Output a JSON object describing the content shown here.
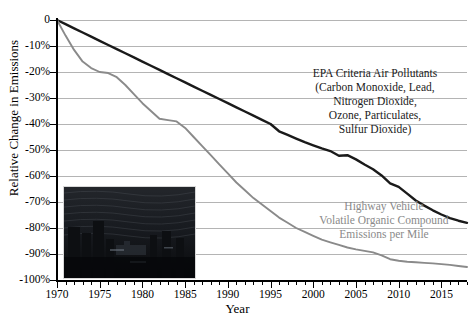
{
  "chart_data": {
    "type": "line",
    "title": "",
    "xlabel": "Year",
    "ylabel": "Relative Change in Emissions",
    "xlim": [
      1970,
      2018
    ],
    "ylim": [
      -100,
      0
    ],
    "grid": true,
    "legend_position": "inline-annotation",
    "x_ticks": [
      "1970",
      "1975",
      "1980",
      "1985",
      "1990",
      "1995",
      "2000",
      "2005",
      "2010",
      "2015"
    ],
    "y_ticks": [
      "0",
      "-10%",
      "-20%",
      "-30%",
      "-40%",
      "-50%",
      "-60%",
      "-70%",
      "-80%",
      "-90%",
      "-100%"
    ],
    "x": [
      1970,
      1971,
      1972,
      1973,
      1974,
      1975,
      1976,
      1977,
      1978,
      1979,
      1980,
      1981,
      1982,
      1983,
      1984,
      1985,
      1986,
      1987,
      1988,
      1989,
      1990,
      1991,
      1992,
      1993,
      1994,
      1995,
      1996,
      1997,
      1998,
      1999,
      2000,
      2001,
      2002,
      2003,
      2004,
      2005,
      2006,
      2007,
      2008,
      2009,
      2010,
      2011,
      2012,
      2013,
      2014,
      2015,
      2016,
      2017,
      2018
    ],
    "series": [
      {
        "name": "EPA Criteria Air Pollutants",
        "color": "#1a1a1a",
        "values": [
          0,
          -1.6,
          -3.2,
          -4.8,
          -6.4,
          -8.0,
          -9.6,
          -11.2,
          -12.8,
          -14.4,
          -16.0,
          -17.6,
          -19.2,
          -20.8,
          -22.4,
          -24.0,
          -25.6,
          -27.2,
          -28.8,
          -30.4,
          -32.0,
          -33.6,
          -35.2,
          -36.8,
          -38.4,
          -40.0,
          -42.8,
          -44.2,
          -45.6,
          -47.0,
          -48.2,
          -49.4,
          -50.4,
          -52.2,
          -52.0,
          -53.6,
          -55.6,
          -57.4,
          -59.8,
          -62.8,
          -64.2,
          -66.8,
          -69.4,
          -71.4,
          -73.2,
          -74.8,
          -76.2,
          -77.2,
          -78.0
        ]
      },
      {
        "name": "Highway Vehicle Volatile Organic Compound Emissions per Mile",
        "color": "#8a8a8a",
        "values": [
          0,
          -6.0,
          -11.5,
          -16.0,
          -18.5,
          -20.0,
          -20.4,
          -22.0,
          -25.0,
          -28.5,
          -32.0,
          -35.0,
          -38.0,
          -38.5,
          -39.0,
          -41.5,
          -45.0,
          -48.5,
          -52.0,
          -55.5,
          -59.0,
          -62.5,
          -65.5,
          -68.5,
          -71.0,
          -73.5,
          -76.0,
          -78.0,
          -80.0,
          -81.5,
          -83.0,
          -84.5,
          -85.5,
          -86.5,
          -87.5,
          -88.2,
          -88.8,
          -89.4,
          -90.5,
          -92.0,
          -92.6,
          -93.0,
          -93.2,
          -93.4,
          -93.6,
          -93.9,
          -94.2,
          -94.6,
          -95.0
        ]
      }
    ],
    "annotations": [
      {
        "id": "annot-black",
        "lines": [
          "EPA Criteria Air Pollutants",
          "(Carbon Monoxide, Lead,",
          "Nitrogen Dioxide,",
          "Ozone, Particulates,",
          "Sulfur Dioxide)"
        ],
        "color": "#1a1a1a"
      },
      {
        "id": "annot-gray",
        "lines": [
          "Highway Vehicle",
          "Volatile Organic Compound",
          "Emissions per Mile"
        ],
        "color": "#8a8a8a"
      }
    ],
    "inset_image": {
      "name": "smoggy-city-skyline-photo",
      "description": "dark photograph of a hazy city skyline"
    }
  },
  "axis": {
    "y_title": "Relative Change in Emissions",
    "x_title": "Year"
  },
  "annot_black": {
    "l1": "EPA Criteria Air Pollutants",
    "l2": "(Carbon Monoxide, Lead,",
    "l3": "Nitrogen Dioxide,",
    "l4": "Ozone, Particulates,",
    "l5": "Sulfur Dioxide)"
  },
  "annot_gray": {
    "l1": "Highway Vehicle",
    "l2": "Volatile Organic Compound",
    "l3": "Emissions per Mile"
  }
}
